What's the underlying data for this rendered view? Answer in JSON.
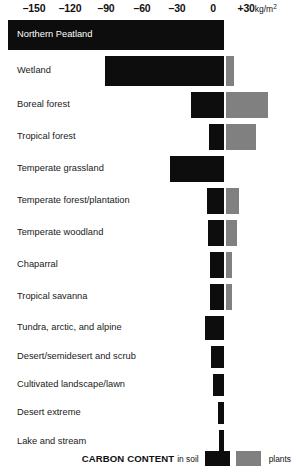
{
  "chart_data": {
    "type": "bar",
    "orientation": "horizontal",
    "title": "CARBON CONTENT",
    "xlabel": "kg/m²",
    "ylabel": "",
    "xlim": [
      -180,
      40
    ],
    "grid": false,
    "stacked": true,
    "axis": {
      "ticks": [
        {
          "value": -150,
          "label": "–150",
          "x_px": 34
        },
        {
          "value": -120,
          "label": "–120",
          "x_px": 70
        },
        {
          "value": -90,
          "label": "–90",
          "x_px": 106
        },
        {
          "value": -60,
          "label": "–60",
          "x_px": 142
        },
        {
          "value": -30,
          "label": "–30",
          "x_px": 177
        },
        {
          "value": 0,
          "label": "0",
          "x_px": 213
        },
        {
          "value": 30,
          "label": "+30",
          "unit": "kg/m²",
          "x_px": 254
        }
      ],
      "zero_px": 224,
      "px_per_unit": 1.19
    },
    "legend": {
      "position": "bottom-right",
      "title": "CARBON CONTENT",
      "soil_label": "in soil",
      "plants_label": "plants",
      "entries": [
        {
          "name": "in soil",
          "color": "#0d0d0d"
        },
        {
          "name": "plants",
          "color": "#808080"
        }
      ]
    },
    "colors": {
      "soil": "#0d0d0d",
      "plants": "#808080",
      "background": "#ffffff",
      "text": "#1a1a1a",
      "inverted_text": "#ffffff"
    },
    "categories": [
      "Northern Peatland",
      "Wetland",
      "Boreal forest",
      "Tropical forest",
      "Temperate grassland",
      "Temperate forest/plantation",
      "Temperate woodland",
      "Chaparral",
      "Tropical savanna",
      "Tundra, arctic, and alpine",
      "Desert/semidesert and scrub",
      "Cultivated landscape/lawn",
      "Desert extreme",
      "Lake and stream"
    ],
    "series": [
      {
        "name": "in soil",
        "color": "#0d0d0d",
        "values": [
          -181,
          -100,
          -28,
          -12,
          -46,
          -14,
          -13,
          -11,
          -11,
          -16,
          -11,
          -9,
          -4,
          -3
        ]
      },
      {
        "name": "plants",
        "color": "#808080",
        "values": [
          0,
          3,
          36,
          26,
          0,
          11,
          9,
          4,
          4,
          0,
          0,
          0,
          0,
          0
        ]
      }
    ],
    "rows": [
      {
        "label": "Northern Peatland",
        "soil": -181,
        "plants": 0,
        "label_inverted": true,
        "bar_left_px": 8,
        "bar_right_px": 224,
        "plants_left_px": 0,
        "plants_right_px": 0,
        "row_top_px": 4,
        "row_h_px": 30
      },
      {
        "label": "Wetland",
        "soil": -100,
        "plants": 3,
        "label_inverted": false,
        "bar_left_px": 105,
        "bar_right_px": 224,
        "plants_left_px": 226,
        "plants_right_px": 234,
        "row_top_px": 36,
        "row_h_px": 30
      },
      {
        "label": "Boreal forest",
        "soil": -28,
        "plants": 36,
        "label_inverted": false,
        "bar_left_px": 191,
        "bar_right_px": 224,
        "plants_left_px": 226,
        "plants_right_px": 268,
        "row_top_px": 72,
        "row_h_px": 26
      },
      {
        "label": "Tropical forest",
        "soil": -12,
        "plants": 26,
        "label_inverted": false,
        "bar_left_px": 209,
        "bar_right_px": 224,
        "plants_left_px": 226,
        "plants_right_px": 256,
        "row_top_px": 104,
        "row_h_px": 26
      },
      {
        "label": "Temperate grassland",
        "soil": -46,
        "plants": 0,
        "label_inverted": false,
        "bar_left_px": 170,
        "bar_right_px": 224,
        "plants_left_px": 0,
        "plants_right_px": 0,
        "row_top_px": 136,
        "row_h_px": 26
      },
      {
        "label": "Temperate forest/plantation",
        "soil": -14,
        "plants": 11,
        "label_inverted": false,
        "bar_left_px": 207,
        "bar_right_px": 224,
        "plants_left_px": 226,
        "plants_right_px": 239,
        "row_top_px": 168,
        "row_h_px": 26
      },
      {
        "label": "Temperate woodland",
        "soil": -13,
        "plants": 9,
        "label_inverted": false,
        "bar_left_px": 208,
        "bar_right_px": 224,
        "plants_left_px": 226,
        "plants_right_px": 237,
        "row_top_px": 200,
        "row_h_px": 26
      },
      {
        "label": "Chaparral",
        "soil": -11,
        "plants": 4,
        "label_inverted": false,
        "bar_left_px": 210,
        "bar_right_px": 224,
        "plants_left_px": 226,
        "plants_right_px": 232,
        "row_top_px": 232,
        "row_h_px": 26
      },
      {
        "label": "Tropical savanna",
        "soil": -11,
        "plants": 4,
        "label_inverted": false,
        "bar_left_px": 210,
        "bar_right_px": 224,
        "plants_left_px": 226,
        "plants_right_px": 232,
        "row_top_px": 264,
        "row_h_px": 26
      },
      {
        "label": "Tundra, arctic, and alpine",
        "soil": -16,
        "plants": 0,
        "label_inverted": false,
        "bar_left_px": 205,
        "bar_right_px": 224,
        "plants_left_px": 0,
        "plants_right_px": 0,
        "row_top_px": 296,
        "row_h_px": 24
      },
      {
        "label": "Desert/semidesert and scrub",
        "soil": -11,
        "plants": 0,
        "label_inverted": false,
        "bar_left_px": 211,
        "bar_right_px": 224,
        "plants_left_px": 0,
        "plants_right_px": 0,
        "row_top_px": 326,
        "row_h_px": 22
      },
      {
        "label": "Cultivated landscape/lawn",
        "soil": -9,
        "plants": 0,
        "label_inverted": false,
        "bar_left_px": 213,
        "bar_right_px": 224,
        "plants_left_px": 0,
        "plants_right_px": 0,
        "row_top_px": 354,
        "row_h_px": 22
      },
      {
        "label": "Desert extreme",
        "soil": -4,
        "plants": 0,
        "label_inverted": false,
        "bar_left_px": 218,
        "bar_right_px": 224,
        "plants_left_px": 0,
        "plants_right_px": 0,
        "row_top_px": 382,
        "row_h_px": 22
      },
      {
        "label": "Lake and stream",
        "soil": -3,
        "plants": 0,
        "label_inverted": false,
        "bar_left_px": 219,
        "bar_right_px": 224,
        "plants_left_px": 0,
        "plants_right_px": 0,
        "row_top_px": 410,
        "row_h_px": 24
      }
    ]
  }
}
